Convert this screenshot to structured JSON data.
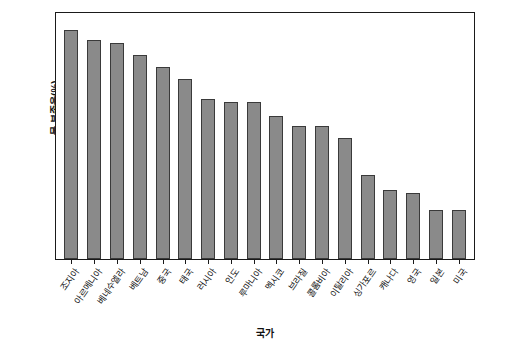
{
  "chart_data": {
    "type": "bar",
    "title": "",
    "xlabel": "국가",
    "ylabel": "물 부족율(%)",
    "ylim": [
      0,
      100
    ],
    "ytick_step": 10,
    "grid": false,
    "legend": null,
    "bar_color": "#8a8a8a",
    "bar_edge_color": "#3a3a3a",
    "categories": [
      "조지아",
      "아르메니아",
      "베네수엘라",
      "베트남",
      "중국",
      "태국",
      "러시아",
      "인도",
      "루마니아",
      "멕시코",
      "브라질",
      "콜롬비아",
      "이탈리아",
      "싱가포르",
      "캐나다",
      "영국",
      "일본",
      "미국"
    ],
    "values": [
      93,
      89,
      88,
      83,
      78,
      73,
      65,
      64,
      64,
      58,
      54,
      54,
      49,
      34,
      28,
      27,
      20,
      20
    ],
    "yticks": [
      0,
      10,
      20,
      30,
      40,
      50,
      60,
      70,
      80,
      90,
      100
    ]
  }
}
